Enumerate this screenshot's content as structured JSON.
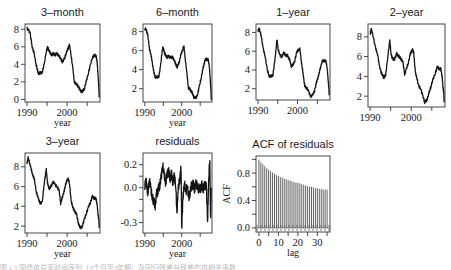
{
  "figure": {
    "panels": [
      {
        "id": "3-month",
        "title": "3–month",
        "xlabel": "year",
        "ylabel": "",
        "box": [
          25,
          24,
          100,
          102
        ],
        "yticks": [
          0,
          2,
          4,
          6,
          8
        ],
        "ylim": [
          -0.3,
          8.6
        ],
        "xticks": [
          1990,
          1995,
          2000,
          2005
        ],
        "xticklabels": [
          "1990",
          "",
          "2000",
          ""
        ],
        "xlim": [
          1989.5,
          2008.2
        ]
      },
      {
        "id": "6-month",
        "title": "6–month",
        "xlabel": "year",
        "ylabel": "",
        "box": [
          143,
          24,
          212,
          102
        ],
        "yticks": [
          2,
          4,
          6,
          8
        ],
        "ylim": [
          0.6,
          8.8
        ],
        "xticks": [
          1990,
          1995,
          2000,
          2005
        ],
        "xticklabels": [
          "1990",
          "",
          "2000",
          ""
        ],
        "xlim": [
          1989.5,
          2008.2
        ]
      },
      {
        "id": "1-year",
        "title": "1–year",
        "xlabel": "",
        "ylabel": "",
        "box": [
          256,
          24,
          330,
          100
        ],
        "yticks": [
          2,
          4,
          6,
          8
        ],
        "ylim": [
          0.8,
          8.9
        ],
        "xticks": [
          1990,
          1995,
          2000,
          2005
        ],
        "xticklabels": [
          "1990",
          "",
          "2000",
          ""
        ],
        "xlim": [
          1989.5,
          2008.2
        ]
      },
      {
        "id": "2-year",
        "title": "2–year",
        "xlabel": "",
        "ylabel": "",
        "box": [
          368,
          24,
          445,
          107
        ],
        "yticks": [
          2,
          4,
          6,
          8
        ],
        "ylim": [
          0.9,
          9.3
        ],
        "xticks": [
          1990,
          1995,
          2000,
          2005
        ],
        "xticklabels": [
          "1990",
          "",
          "2000",
          ""
        ],
        "xlim": [
          1989.5,
          2008.2
        ]
      },
      {
        "id": "3-year",
        "title": "3–year",
        "xlabel": "year",
        "ylabel": "",
        "box": [
          25,
          153,
          100,
          233
        ],
        "yticks": [
          2,
          4,
          6,
          8
        ],
        "ylim": [
          1.3,
          9.4
        ],
        "xticks": [
          1990,
          1995,
          2000,
          2005
        ],
        "xticklabels": [
          "1990",
          "",
          "2000",
          ""
        ],
        "xlim": [
          1989.5,
          2008.2
        ]
      },
      {
        "id": "residuals",
        "title": "residuals",
        "xlabel": "year",
        "ylabel": "",
        "box": [
          143,
          153,
          212,
          233
        ],
        "yticks": [
          -0.3,
          -0.2,
          -0.1,
          0.0,
          0.1,
          0.2
        ],
        "yticklabels": [
          "-0.3",
          "",
          "",
          "0.0",
          "",
          "0.2"
        ],
        "ylim": [
          -0.39,
          0.3
        ],
        "xticks": [
          1990,
          1995,
          2000,
          2005
        ],
        "xticklabels": [
          "1990",
          "",
          "2000",
          ""
        ],
        "xlim": [
          1989.5,
          2008.2
        ]
      },
      {
        "id": "acf",
        "title": "ACF of residuals",
        "xlabel": "lag",
        "ylabel": "ACF",
        "box": [
          256,
          156,
          330,
          232
        ],
        "yticks": [
          0.0,
          0.2,
          0.4,
          0.6,
          0.8,
          1.0
        ],
        "yticklabels": [
          "0.0",
          "",
          "0.4",
          "",
          "0.8",
          ""
        ],
        "ylim": [
          -0.06,
          1.05
        ],
        "xticks": [
          0,
          5,
          10,
          15,
          20,
          25,
          30,
          35
        ],
        "xticklabels": [
          "0",
          "",
          "10",
          "",
          "20",
          "",
          "30",
          ""
        ],
        "xlim": [
          -1.5,
          36.5
        ]
      }
    ],
    "caption": "图 1.5  国债收益率时间序列（3个月至3年期）及回归残差与残差的自相关函数"
  },
  "chart_data": [
    {
      "type": "line",
      "title": "3–month",
      "xlabel": "year",
      "ylabel": "",
      "xlim": [
        1990,
        2008
      ],
      "ylim": [
        0,
        8.5
      ],
      "x": [
        1990.0,
        1990.3,
        1990.8,
        1991.3,
        1991.8,
        1992.3,
        1992.8,
        1993.3,
        1993.8,
        1994.3,
        1994.8,
        1995.1,
        1995.5,
        1996.0,
        1996.5,
        1997.0,
        1997.5,
        1998.0,
        1998.4,
        1998.8,
        1999.3,
        1999.8,
        2000.3,
        2000.6,
        2001.0,
        2001.4,
        2001.8,
        2002.3,
        2002.8,
        2003.3,
        2003.8,
        2004.3,
        2004.8,
        2005.3,
        2005.8,
        2006.3,
        2006.8,
        2007.2,
        2007.5,
        2007.7,
        2007.9,
        2008.0
      ],
      "values": [
        8.1,
        8.0,
        7.5,
        6.0,
        5.2,
        3.9,
        3.0,
        3.0,
        3.1,
        4.0,
        5.5,
        5.9,
        5.6,
        5.1,
        5.2,
        5.1,
        5.2,
        5.0,
        4.6,
        4.3,
        4.6,
        5.3,
        5.9,
        6.2,
        5.0,
        3.6,
        2.0,
        1.7,
        1.5,
        1.0,
        0.9,
        1.2,
        2.1,
        3.0,
        3.9,
        4.8,
        5.0,
        5.0,
        4.2,
        2.8,
        1.5,
        0.2
      ]
    },
    {
      "type": "line",
      "title": "6–month",
      "xlabel": "year",
      "ylabel": "",
      "xlim": [
        1990,
        2008
      ],
      "ylim": [
        1,
        8.5
      ],
      "x": [
        1990.0,
        1990.3,
        1990.8,
        1991.3,
        1991.8,
        1992.3,
        1992.8,
        1993.3,
        1993.8,
        1994.3,
        1994.8,
        1995.1,
        1995.5,
        1996.0,
        1996.5,
        1997.0,
        1997.5,
        1998.0,
        1998.4,
        1998.8,
        1999.3,
        1999.8,
        2000.3,
        2000.6,
        2001.0,
        2001.4,
        2001.8,
        2002.3,
        2002.8,
        2003.3,
        2003.8,
        2004.3,
        2004.8,
        2005.3,
        2005.8,
        2006.3,
        2006.8,
        2007.2,
        2007.5,
        2007.7,
        2007.9,
        2008.0
      ],
      "values": [
        8.2,
        8.3,
        7.6,
        6.1,
        5.3,
        4.0,
        3.2,
        3.2,
        3.3,
        4.5,
        6.3,
        6.1,
        5.6,
        5.3,
        5.4,
        5.3,
        5.3,
        5.0,
        4.5,
        4.3,
        4.8,
        5.6,
        6.2,
        6.4,
        5.0,
        3.6,
        2.1,
        1.9,
        1.6,
        1.1,
        1.0,
        1.4,
        2.3,
        3.2,
        4.2,
        5.0,
        5.1,
        5.0,
        4.3,
        3.0,
        1.9,
        0.8
      ]
    },
    {
      "type": "line",
      "title": "1–year",
      "xlabel": "",
      "ylabel": "",
      "xlim": [
        1990,
        2008
      ],
      "ylim": [
        1,
        8.5
      ],
      "x": [
        1990.0,
        1990.3,
        1990.8,
        1991.3,
        1991.8,
        1992.3,
        1992.8,
        1993.3,
        1993.8,
        1994.3,
        1994.8,
        1995.1,
        1995.5,
        1996.0,
        1996.5,
        1997.0,
        1997.5,
        1998.0,
        1998.4,
        1998.8,
        1999.3,
        1999.8,
        2000.3,
        2000.6,
        2001.0,
        2001.4,
        2001.8,
        2002.3,
        2002.8,
        2003.3,
        2003.8,
        2004.3,
        2004.8,
        2005.3,
        2005.8,
        2006.3,
        2006.8,
        2007.2,
        2007.5,
        2007.7,
        2007.9,
        2008.0
      ],
      "values": [
        8.2,
        8.4,
        7.7,
        6.3,
        5.5,
        4.1,
        3.4,
        3.3,
        3.5,
        5.2,
        7.2,
        6.2,
        5.6,
        5.4,
        5.8,
        5.6,
        5.5,
        5.1,
        4.4,
        4.5,
        5.0,
        5.9,
        6.2,
        6.2,
        4.8,
        3.6,
        2.3,
        2.1,
        1.7,
        1.2,
        1.3,
        1.8,
        2.7,
        3.4,
        4.3,
        5.0,
        5.0,
        4.9,
        4.2,
        3.0,
        2.2,
        1.3
      ]
    },
    {
      "type": "line",
      "title": "2–year",
      "xlabel": "",
      "ylabel": "",
      "xlim": [
        1990,
        2008
      ],
      "ylim": [
        1,
        9
      ],
      "x": [
        1990.0,
        1990.3,
        1990.8,
        1991.3,
        1991.8,
        1992.3,
        1992.8,
        1993.3,
        1993.8,
        1994.3,
        1994.8,
        1995.1,
        1995.5,
        1996.0,
        1996.5,
        1997.0,
        1997.5,
        1998.0,
        1998.4,
        1998.8,
        1999.3,
        1999.8,
        2000.3,
        2000.6,
        2001.0,
        2001.4,
        2001.8,
        2002.3,
        2002.8,
        2003.3,
        2003.8,
        2004.3,
        2004.8,
        2005.3,
        2005.8,
        2006.3,
        2006.8,
        2007.2,
        2007.5,
        2007.7,
        2007.9,
        2008.0
      ],
      "values": [
        8.3,
        8.8,
        8.0,
        6.9,
        6.3,
        5.0,
        4.3,
        3.9,
        4.1,
        6.0,
        7.6,
        6.3,
        5.7,
        5.8,
        6.3,
        6.0,
        5.8,
        5.4,
        4.2,
        4.7,
        5.4,
        6.3,
        6.7,
        6.4,
        4.4,
        3.8,
        3.0,
        2.8,
        2.0,
        1.4,
        1.6,
        2.3,
        3.0,
        3.7,
        4.3,
        4.9,
        4.8,
        4.7,
        4.0,
        3.0,
        2.3,
        1.4
      ]
    },
    {
      "type": "line",
      "title": "3–year",
      "xlabel": "year",
      "ylabel": "",
      "xlim": [
        1990,
        2008
      ],
      "ylim": [
        1.5,
        9
      ],
      "x": [
        1990.0,
        1990.3,
        1990.8,
        1991.3,
        1991.8,
        1992.3,
        1992.8,
        1993.3,
        1993.8,
        1994.3,
        1994.8,
        1995.1,
        1995.5,
        1996.0,
        1996.5,
        1997.0,
        1997.5,
        1998.0,
        1998.4,
        1998.8,
        1999.3,
        1999.8,
        2000.3,
        2000.6,
        2001.0,
        2001.4,
        2001.8,
        2002.3,
        2002.8,
        2003.3,
        2003.8,
        2004.3,
        2004.8,
        2005.3,
        2005.8,
        2006.3,
        2006.8,
        2007.2,
        2007.5,
        2007.7,
        2007.9,
        2008.0
      ],
      "values": [
        8.4,
        8.9,
        8.2,
        7.3,
        6.8,
        5.5,
        4.8,
        4.3,
        4.4,
        6.4,
        7.7,
        6.4,
        5.8,
        6.0,
        6.5,
        6.2,
        6.0,
        5.6,
        4.3,
        4.9,
        5.6,
        6.5,
        6.8,
        6.3,
        4.5,
        4.0,
        3.5,
        3.3,
        2.3,
        1.8,
        2.0,
        2.7,
        3.3,
        3.9,
        4.4,
        5.0,
        4.8,
        4.8,
        4.1,
        3.2,
        2.6,
        1.8
      ]
    },
    {
      "type": "line",
      "title": "residuals",
      "xlabel": "year",
      "ylabel": "",
      "xlim": [
        1990,
        2008
      ],
      "ylim": [
        -0.35,
        0.28
      ],
      "x": [
        1990.0,
        1990.4,
        1990.8,
        1991.2,
        1991.6,
        1992.0,
        1992.4,
        1992.8,
        1993.2,
        1993.6,
        1994.0,
        1994.4,
        1994.8,
        1995.2,
        1995.6,
        1996.0,
        1996.4,
        1996.8,
        1997.2,
        1997.6,
        1998.0,
        1998.4,
        1998.7,
        1999.0,
        1999.4,
        1999.8,
        2000.0,
        2000.3,
        2000.7,
        2001.1,
        2001.5,
        2001.9,
        2002.3,
        2002.7,
        2003.1,
        2003.5,
        2003.9,
        2004.3,
        2004.7,
        2005.1,
        2005.5,
        2005.9,
        2006.3,
        2006.7,
        2007.0,
        2007.3,
        2007.6,
        2007.8,
        2008.0
      ],
      "values": [
        0.02,
        0.05,
        -0.05,
        0.06,
        0.0,
        -0.08,
        -0.12,
        -0.15,
        -0.05,
        -0.02,
        0.02,
        0.08,
        0.2,
        0.12,
        0.05,
        0.1,
        0.15,
        0.08,
        0.12,
        0.05,
        0.1,
        0.02,
        -0.25,
        0.0,
        0.05,
        0.18,
        -0.35,
        -0.1,
        0.05,
        -0.05,
        0.03,
        -0.1,
        -0.03,
        0.02,
        0.03,
        -0.01,
        0.04,
        0.01,
        -0.02,
        0.0,
        0.02,
        -0.01,
        0.03,
        0.0,
        -0.28,
        0.05,
        0.27,
        -0.28,
        0.0
      ]
    },
    {
      "type": "bar",
      "title": "ACF of residuals",
      "xlabel": "lag",
      "ylabel": "ACF",
      "xlim": [
        0,
        35
      ],
      "ylim": [
        0,
        1
      ],
      "categories": [
        0,
        1,
        2,
        3,
        4,
        5,
        6,
        7,
        8,
        9,
        10,
        11,
        12,
        13,
        14,
        15,
        16,
        17,
        18,
        19,
        20,
        21,
        22,
        23,
        24,
        25,
        26,
        27,
        28,
        29,
        30,
        31,
        32,
        33,
        34,
        35
      ],
      "values": [
        1.0,
        0.96,
        0.93,
        0.9,
        0.87,
        0.85,
        0.83,
        0.81,
        0.79,
        0.77,
        0.76,
        0.74,
        0.73,
        0.72,
        0.71,
        0.7,
        0.69,
        0.68,
        0.67,
        0.66,
        0.66,
        0.65,
        0.64,
        0.63,
        0.62,
        0.61,
        0.6,
        0.6,
        0.59,
        0.58,
        0.58,
        0.57,
        0.57,
        0.56,
        0.56,
        0.56
      ],
      "confidence_band": [
        -0.03,
        0.03
      ]
    }
  ]
}
